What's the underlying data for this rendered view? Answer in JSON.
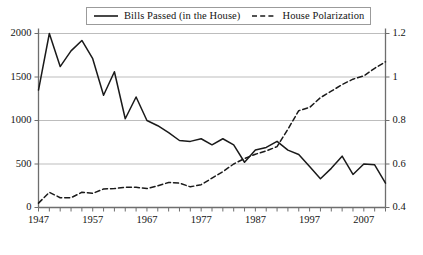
{
  "chart_data": {
    "type": "line",
    "title": "",
    "subtitle": "",
    "xlabel": "",
    "ylabel": "",
    "y2label": "",
    "grid": true,
    "legend_position": "top",
    "xlim": [
      1947,
      2011
    ],
    "ylim": [
      0,
      2000
    ],
    "y2lim": [
      0.4,
      1.2
    ],
    "x_tick_interval": 2,
    "x_tick_labels": [
      "1947",
      "1957",
      "1967",
      "1977",
      "1987",
      "1997",
      "2007"
    ],
    "x_tick_label_values": [
      1947,
      1957,
      1967,
      1977,
      1987,
      1997,
      2007
    ],
    "y_tick_labels": [
      "0",
      "500",
      "1000",
      "1500",
      "2000"
    ],
    "y_tick_values": [
      0,
      500,
      1000,
      1500,
      2000
    ],
    "y2_tick_labels": [
      "0.4",
      "0.6",
      "0.8",
      "1",
      "1.2"
    ],
    "y2_tick_values": [
      0.4,
      0.6,
      0.8,
      1.0,
      1.2
    ],
    "x": [
      1947,
      1949,
      1951,
      1953,
      1955,
      1957,
      1959,
      1961,
      1963,
      1965,
      1967,
      1969,
      1971,
      1973,
      1975,
      1977,
      1979,
      1981,
      1983,
      1985,
      1987,
      1989,
      1991,
      1993,
      1995,
      1997,
      1999,
      2001,
      2003,
      2005,
      2007,
      2009,
      2011
    ],
    "series": [
      {
        "name": "Bills Passed (in the House)",
        "axis": "left",
        "style": "solid",
        "color": "#1a1a1a",
        "values": [
          1350,
          2000,
          1620,
          1800,
          1920,
          1710,
          1290,
          1560,
          1020,
          1270,
          1000,
          940,
          860,
          770,
          760,
          790,
          720,
          790,
          720,
          520,
          660,
          690,
          760,
          660,
          610,
          470,
          330,
          450,
          590,
          380,
          500,
          490,
          280
        ]
      },
      {
        "name": "House Polarization",
        "axis": "right",
        "style": "dashed",
        "color": "#1a1a1a",
        "values": [
          0.42,
          0.47,
          0.445,
          0.445,
          0.47,
          0.465,
          0.485,
          0.487,
          0.493,
          0.493,
          0.487,
          0.5,
          0.515,
          0.512,
          0.495,
          0.505,
          0.535,
          0.565,
          0.6,
          0.625,
          0.645,
          0.66,
          0.68,
          0.76,
          0.845,
          0.86,
          0.905,
          0.935,
          0.965,
          0.99,
          1.005,
          1.04,
          1.07
        ]
      }
    ]
  },
  "legend": {
    "entries": [
      {
        "label": "Bills Passed (in the House)",
        "style": "solid"
      },
      {
        "label": "House Polarization",
        "style": "dashed"
      }
    ]
  }
}
